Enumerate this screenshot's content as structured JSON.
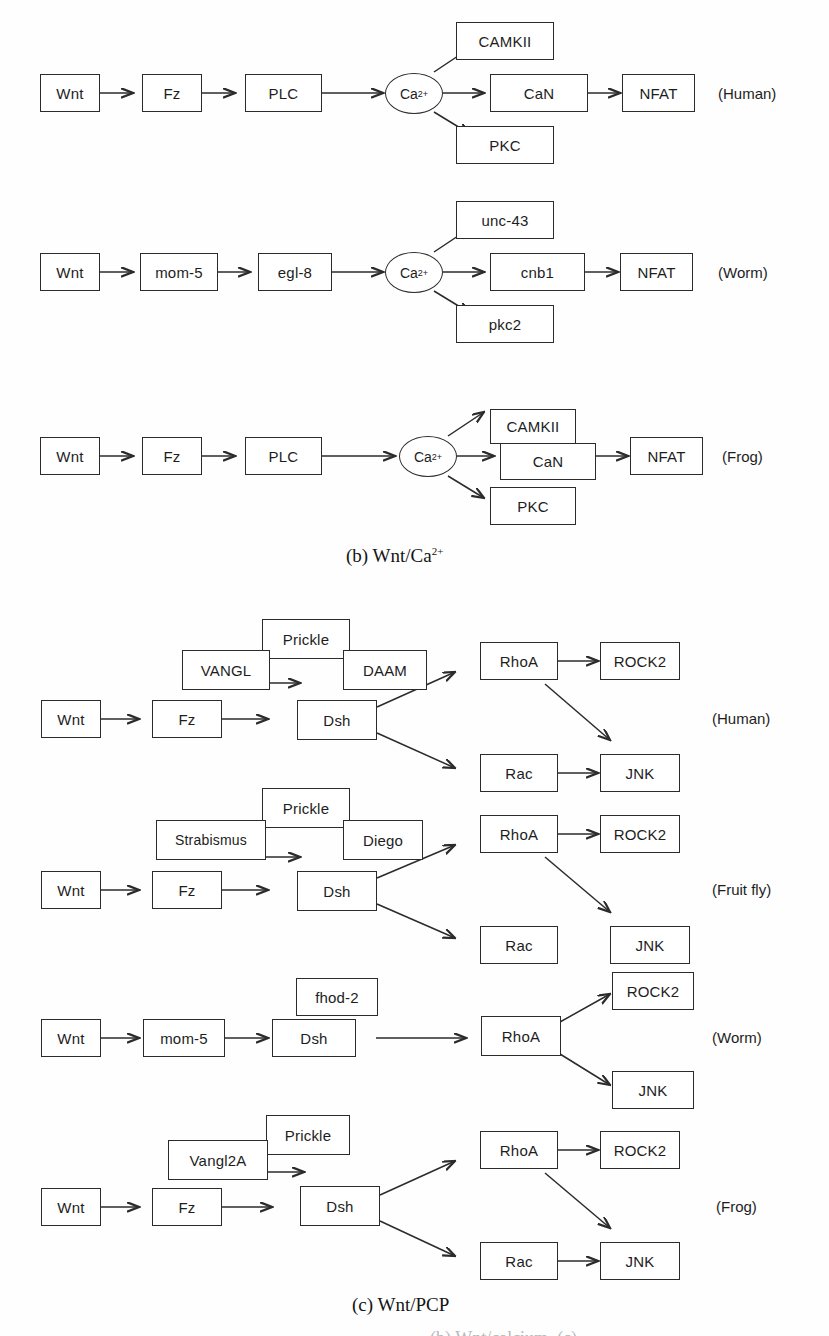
{
  "figure": {
    "background_color": "#fefefe",
    "line_color": "#2b2b2b",
    "text_color": "#1d1d1d"
  },
  "panel_b": {
    "caption": "(b) Wnt/Ca",
    "caption_sup": "2+",
    "rows": [
      {
        "species": "(Human)",
        "chain": [
          "Wnt",
          "Fz",
          "PLC"
        ],
        "hub": "Ca",
        "hub_sup": "2+",
        "branches": [
          "CAMKII",
          "CaN",
          "PKC"
        ],
        "terminal": "NFAT"
      },
      {
        "species": "(Worm)",
        "chain": [
          "Wnt",
          "mom-5",
          "egl-8"
        ],
        "hub": "Ca",
        "hub_sup": "2+",
        "branches": [
          "unc-43",
          "cnb1",
          "pkc2"
        ],
        "terminal": "NFAT"
      },
      {
        "species": "(Frog)",
        "chain": [
          "Wnt",
          "Fz",
          "PLC"
        ],
        "hub": "Ca",
        "hub_sup": "2+",
        "branches": [
          "CAMKII",
          "CaN",
          "PKC"
        ],
        "terminal": "NFAT"
      }
    ]
  },
  "panel_c": {
    "caption": "(c) Wnt/PCP",
    "rows": [
      {
        "species": "(Human)",
        "chain": [
          "Wnt",
          "Fz",
          "Dsh"
        ],
        "complex_top": "Prickle",
        "complex_left": "VANGL",
        "complex_right": "DAAM",
        "effectors": [
          "RhoA",
          "Rac"
        ],
        "outputs": [
          "ROCK2",
          "JNK"
        ],
        "rac_to_jnk": true
      },
      {
        "species": "(Fruit fly)",
        "chain": [
          "Wnt",
          "Fz",
          "Dsh"
        ],
        "complex_top": "Prickle",
        "complex_left": "Strabismus",
        "complex_right": "Diego",
        "effectors": [
          "RhoA",
          "Rac"
        ],
        "outputs": [
          "ROCK2",
          "JNK"
        ],
        "rac_to_jnk": false
      },
      {
        "species": "(Worm)",
        "chain": [
          "Wnt",
          "mom-5",
          "Dsh"
        ],
        "complex_top": "fhod-2",
        "effector": "RhoA",
        "outputs": [
          "ROCK2",
          "JNK"
        ]
      },
      {
        "species": "(Frog)",
        "chain": [
          "Wnt",
          "Fz",
          "Dsh"
        ],
        "complex_top": "Prickle",
        "complex_left": "Vangl2A",
        "effectors": [
          "RhoA",
          "Rac"
        ],
        "outputs": [
          "ROCK2",
          "JNK"
        ],
        "rac_to_jnk": true
      }
    ]
  },
  "bottom_cutoff_text": "(b) Wnt/calcium, (c)"
}
